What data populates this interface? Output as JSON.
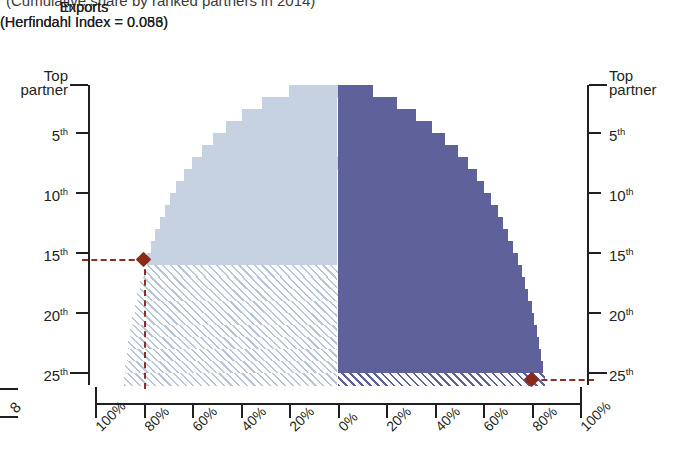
{
  "figure": {
    "subtitle": "(Cumulative share by ranked partners in 2014)"
  },
  "panels": {
    "left": {
      "name": "Imports",
      "index_label": "(Herfindahl Index = 0.086)",
      "herfindahl_index": 0.086,
      "color": "#c6d1e1"
    },
    "right": {
      "name": "Exports",
      "index_label": "(Herfindahl Index = 0.053)",
      "herfindahl_index": 0.053,
      "color": "#5e619a"
    }
  },
  "axes": {
    "y_left_title_line1": "Top",
    "y_left_title_line2": "partner",
    "y_right_title_line1": "Top",
    "y_right_title_line2": "partner",
    "y_ticks": [
      "Top partner",
      "5th",
      "10th",
      "15th",
      "20th",
      "25th"
    ],
    "y_tick_ranks": [
      1,
      5,
      10,
      15,
      20,
      25
    ],
    "y_tick_nums": [
      "",
      "5",
      "10",
      "15",
      "20",
      "25"
    ],
    "y_tick_sups": [
      "",
      "th",
      "th",
      "th",
      "th",
      "th"
    ],
    "x_ticks_left": [
      "100%",
      "80%",
      "60%",
      "40%",
      "20%",
      "0%"
    ],
    "x_ticks_right": [
      "0%",
      "20%",
      "40%",
      "60%",
      "80%",
      "100%"
    ],
    "x_range_percent": [
      0,
      100
    ],
    "x_direction_left": "descending",
    "x_direction_right": "ascending",
    "corner_label": "8"
  },
  "markers": {
    "imports": {
      "rank": 15,
      "rank_label": "15th",
      "share_percent": 80,
      "color": "#8b2a18",
      "shape": "diamond"
    },
    "exports": {
      "rank": 25,
      "rank_label": "25th",
      "share_percent": 80,
      "color": "#8b2a18",
      "shape": "diamond"
    }
  },
  "chart_data": {
    "type": "bar",
    "title": "",
    "subtitle": "(Cumulative share by ranked partners in 2014)",
    "orientation": "horizontal",
    "layout": "mirrored butterfly / tornado",
    "xlabel": "",
    "ylabel": "Ranked partner",
    "xlim": [
      0,
      100
    ],
    "ylim": [
      1,
      25
    ],
    "grid": false,
    "legend": "none (panel headings used instead)",
    "categories": [
      "Top partner",
      "2nd",
      "3rd",
      "4th",
      "5th",
      "6th",
      "7th",
      "8th",
      "9th",
      "10th",
      "11th",
      "12th",
      "13th",
      "14th",
      "15th",
      "16th",
      "17th",
      "18th",
      "19th",
      "20th",
      "21st",
      "22nd",
      "23rd",
      "24th",
      "25th"
    ],
    "series": [
      {
        "name": "Imports",
        "herfindahl_index": 0.086,
        "unit": "% cumulative share",
        "direction": "left",
        "color": "#c6d1e1",
        "values": [
          20.0,
          31.0,
          39.5,
          46.0,
          51.5,
          56.0,
          60.0,
          63.5,
          66.5,
          69.0,
          71.3,
          73.3,
          75.2,
          77.0,
          78.6,
          80.0,
          81.3,
          82.5,
          83.6,
          84.6,
          85.5,
          86.3,
          87.0,
          87.6,
          88.1
        ],
        "highlight": {
          "rank": 15,
          "value": 80.0,
          "note": "top 15 partners account for ~80% of imports"
        }
      },
      {
        "name": "Exports",
        "herfindahl_index": 0.053,
        "unit": "% cumulative share",
        "direction": "right",
        "color": "#5e619a",
        "values": [
          14.5,
          24.5,
          32.5,
          39.0,
          44.5,
          49.5,
          54.0,
          57.5,
          60.5,
          63.5,
          66.0,
          68.3,
          70.5,
          72.5,
          74.3,
          76.0,
          77.4,
          78.7,
          80.0,
          81.1,
          82.2,
          83.1,
          84.0,
          84.8,
          85.5
        ],
        "highlight": {
          "rank": 25,
          "value": 80.0,
          "note": "it takes ~25 partners to reach ~80% of exports"
        }
      }
    ]
  }
}
